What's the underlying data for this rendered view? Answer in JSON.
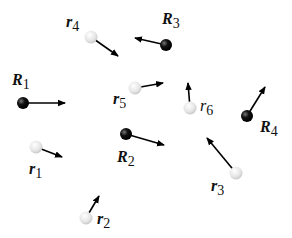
{
  "diagram": {
    "colors": {
      "nucleus": "#111111",
      "electron": "#e6e6e6",
      "arrow": "#000000",
      "background": "#ffffff"
    },
    "particles": [
      {
        "id": "R1",
        "kind": "nucleus",
        "letter": "R",
        "index": "1",
        "bold": true,
        "x": 23,
        "y": 103,
        "ax": 65,
        "ay": 103,
        "lx": 12,
        "ly": 85
      },
      {
        "id": "r4",
        "kind": "electron",
        "letter": "r",
        "index": "4",
        "bold": true,
        "x": 91,
        "y": 37,
        "ax": 118,
        "ay": 56,
        "lx": 66,
        "ly": 27
      },
      {
        "id": "R3",
        "kind": "nucleus",
        "letter": "R",
        "index": "3",
        "bold": true,
        "x": 166,
        "y": 45,
        "ax": 135,
        "ay": 38,
        "lx": 162,
        "ly": 24
      },
      {
        "id": "r5",
        "kind": "electron",
        "letter": "r",
        "index": "5",
        "bold": true,
        "x": 135,
        "y": 88,
        "ax": 163,
        "ay": 83,
        "lx": 113,
        "ly": 104
      },
      {
        "id": "r6",
        "kind": "electron",
        "letter": "r",
        "index": "6",
        "bold": false,
        "x": 190,
        "y": 108,
        "ax": 188,
        "ay": 83,
        "lx": 200,
        "ly": 111
      },
      {
        "id": "R4",
        "kind": "nucleus",
        "letter": "R",
        "index": "4",
        "bold": true,
        "x": 247,
        "y": 116,
        "ax": 265,
        "ay": 87,
        "lx": 260,
        "ly": 132
      },
      {
        "id": "r1",
        "kind": "electron",
        "letter": "r",
        "index": "1",
        "bold": true,
        "x": 36,
        "y": 147,
        "ax": 62,
        "ay": 157,
        "lx": 29,
        "ly": 174
      },
      {
        "id": "R2",
        "kind": "nucleus",
        "letter": "R",
        "index": "2",
        "bold": true,
        "x": 126,
        "y": 134,
        "ax": 164,
        "ay": 145,
        "lx": 117,
        "ly": 162
      },
      {
        "id": "r2",
        "kind": "electron",
        "letter": "r",
        "index": "2",
        "bold": true,
        "x": 86,
        "y": 218,
        "ax": 99,
        "ay": 196,
        "lx": 97,
        "ly": 224
      },
      {
        "id": "r3",
        "kind": "electron",
        "letter": "r",
        "index": "3",
        "bold": true,
        "x": 236,
        "y": 173,
        "ax": 207,
        "ay": 138,
        "lx": 211,
        "ly": 191
      }
    ]
  }
}
